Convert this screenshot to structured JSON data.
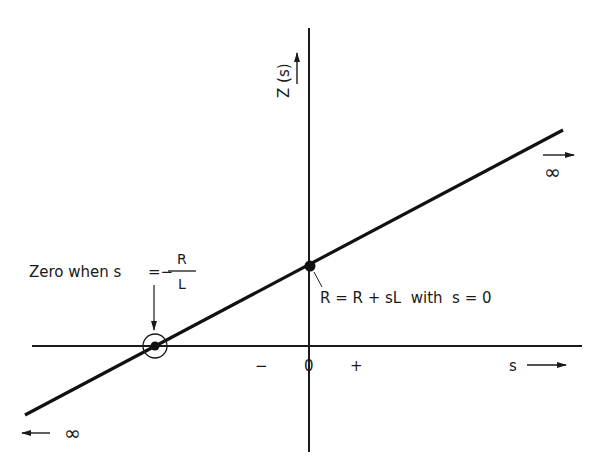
{
  "diagram": {
    "type": "impedance-vs-s-plot",
    "axes": {
      "vertical_label": "Z (s)",
      "horizontal_label": "s",
      "origin_label": "0",
      "negative_label": "−",
      "positive_label": "+"
    },
    "line": {
      "description": "Z(s) = R + sL, straight line through zero at s = -R/L",
      "right_end_label": "∞",
      "left_end_label": "∞"
    },
    "annotations": {
      "zero": {
        "prefix": "Zero when s",
        "equals": "=−",
        "numerator": "R",
        "denominator": "L"
      },
      "intercept": {
        "text": "R = R + sL  with  s = 0"
      }
    },
    "colors": {
      "ink": "#1a1a1a",
      "background": "#ffffff"
    }
  }
}
